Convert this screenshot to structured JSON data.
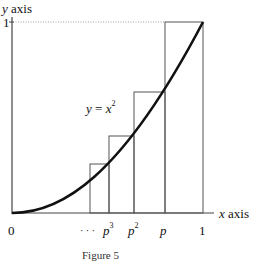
{
  "diagram": {
    "y_axis_label_var": "y",
    "y_axis_label_word": "axis",
    "x_axis_label_var": "x",
    "x_axis_label_word": "axis",
    "y_tick_1": "1",
    "x_ticks": {
      "origin": "0",
      "dots": "· · ·",
      "p3_base": "p",
      "p3_exp": "3",
      "p2_base": "p",
      "p2_exp": "2",
      "p": "p",
      "one": "1"
    },
    "curve_label_lhs": "y",
    "curve_label_eq": "=",
    "curve_label_base": "x",
    "curve_label_exp": "2",
    "caption": "Figure 5"
  }
}
